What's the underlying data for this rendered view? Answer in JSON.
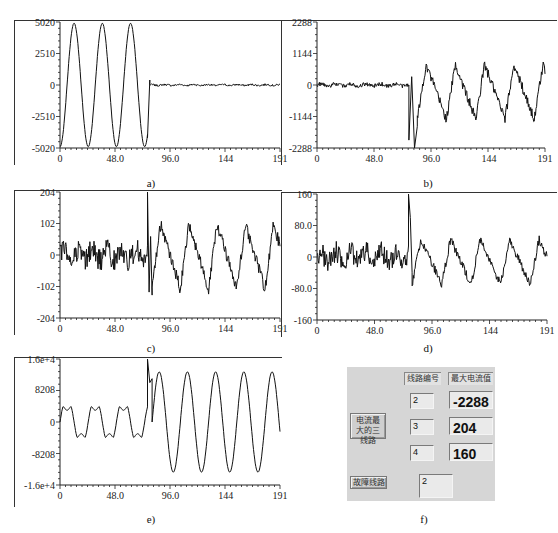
{
  "chart_data": [
    {
      "id": "a",
      "type": "line",
      "caption": "a)",
      "title": "",
      "xlabel": "",
      "ylabel": "",
      "xlim": [
        0,
        191
      ],
      "ylim": [
        -5020,
        5020
      ],
      "xticks": [
        "0",
        "48.0",
        "96.0",
        "144",
        "191"
      ],
      "xtick_values": [
        0,
        48,
        96,
        144,
        191
      ],
      "yticks": [
        "5020",
        "2510",
        "0",
        "-2510",
        "-5020"
      ],
      "ytick_values": [
        5020,
        2510,
        0,
        -2510,
        -5020
      ],
      "grid": false,
      "description": "Sinusoid amplitude ~5020 with period ~24 samples from x=0 to ~76, then drops to near-zero noise (~±100) for remainder.",
      "series": [
        {
          "name": "line-1",
          "segments": [
            {
              "x_start": 0,
              "x_end": 76,
              "shape": "sine",
              "amplitude": 5020,
              "period": 24.5,
              "phase_deg": -90
            },
            {
              "x_start": 76,
              "x_end": 78,
              "shape": "spike",
              "values": [
                -4200,
                400
              ]
            },
            {
              "x_start": 78,
              "x_end": 191,
              "shape": "noise",
              "mean": 0,
              "amplitude": 120
            }
          ]
        }
      ]
    },
    {
      "id": "b",
      "type": "line",
      "caption": "b)",
      "xlim": [
        0,
        191
      ],
      "ylim": [
        -2288,
        2288
      ],
      "xticks": [
        "0",
        "48.0",
        "96.0",
        "144",
        "191"
      ],
      "xtick_values": [
        0,
        48,
        96,
        144,
        191
      ],
      "yticks": [
        "2288",
        "1144",
        "0",
        "-1144",
        "-2288"
      ],
      "ytick_values": [
        2288,
        1144,
        0,
        -1144,
        -2288
      ],
      "grid": false,
      "description": "Near-zero noise until x~77, sharp negative dip to -2288 around x~80, then sawtooth-like oscillation between ~-1200 and ~+800 with period ~24.",
      "series": [
        {
          "name": "line-2",
          "segments": [
            {
              "x_start": 0,
              "x_end": 77,
              "shape": "noise",
              "mean": 0,
              "amplitude": 120
            },
            {
              "x_start": 77,
              "x_end": 84,
              "shape": "spike",
              "values": [
                -2000,
                300,
                -2288,
                -1500
              ]
            },
            {
              "x_start": 84,
              "x_end": 191,
              "shape": "sawtooth",
              "min": -1250,
              "max": 750,
              "period": 24.5
            }
          ]
        }
      ]
    },
    {
      "id": "c",
      "type": "line",
      "caption": "c)",
      "xlim": [
        0,
        191
      ],
      "ylim": [
        -204,
        204
      ],
      "xticks": [
        "0",
        "48.0",
        "96.0",
        "144",
        "191"
      ],
      "xtick_values": [
        0,
        48,
        96,
        144,
        191
      ],
      "yticks": [
        "204",
        "102",
        "0",
        "-102",
        "-204"
      ],
      "ytick_values": [
        204,
        102,
        0,
        -102,
        -204
      ],
      "grid": false,
      "description": "Noisy signal around 0 (±60) until x~77, spike to 204 at x~77, then oscillation between ~-120 and ~+100 with period ~24 plus noise.",
      "series": [
        {
          "name": "line-3",
          "segments": [
            {
              "x_start": 0,
              "x_end": 76,
              "shape": "noise",
              "mean": 0,
              "amplitude": 60
            },
            {
              "x_start": 76,
              "x_end": 80,
              "shape": "spike",
              "values": [
                204,
                -120,
                60,
                -130
              ]
            },
            {
              "x_start": 80,
              "x_end": 191,
              "shape": "sawtooth",
              "min": -110,
              "max": 100,
              "period": 24.5
            }
          ]
        }
      ]
    },
    {
      "id": "d",
      "type": "line",
      "caption": "d)",
      "xlim": [
        0,
        191
      ],
      "ylim": [
        -160,
        160
      ],
      "xticks": [
        "0",
        "48.0",
        "96.0",
        "144",
        "191"
      ],
      "xtick_values": [
        0,
        48,
        96,
        144,
        191
      ],
      "yticks": [
        "160",
        "80.0",
        "0",
        "-80.0",
        "-160"
      ],
      "ytick_values": [
        160,
        80,
        0,
        -80,
        -160
      ],
      "grid": false,
      "description": "Noisy signal around 0 (±50) until x~77, spike to 160 at x~77, then oscillation between ~-70 and ~+45 with period ~24 plus noise.",
      "series": [
        {
          "name": "line-4",
          "segments": [
            {
              "x_start": 0,
              "x_end": 76,
              "shape": "noise",
              "mean": 0,
              "amplitude": 45
            },
            {
              "x_start": 76,
              "x_end": 79,
              "shape": "spike",
              "values": [
                160,
                100,
                -40
              ]
            },
            {
              "x_start": 79,
              "x_end": 191,
              "shape": "sawtooth",
              "min": -70,
              "max": 45,
              "period": 24.5
            }
          ]
        }
      ]
    },
    {
      "id": "e",
      "type": "line",
      "caption": "e)",
      "xlim": [
        0,
        191
      ],
      "ylim": [
        -16000,
        16000
      ],
      "xticks": [
        "0",
        "48.0",
        "96.0",
        "144",
        "191"
      ],
      "xtick_values": [
        0,
        48,
        96,
        144,
        191
      ],
      "yticks": [
        "1.6e+4",
        "8208",
        "0",
        "-8208",
        "-1.6e+4"
      ],
      "ytick_values": [
        16000,
        8208,
        0,
        -8208,
        -16000
      ],
      "grid": false,
      "description": "Flat-topped periodic wave amplitude ~3500 until x~77, jump to 1.6e+4 at x~77, then large sinusoid amplitude ~13000 with period ~24.5.",
      "series": [
        {
          "name": "zero-sequence",
          "segments": [
            {
              "x_start": 0,
              "x_end": 76,
              "shape": "flat-top-wave",
              "amplitude": 3500,
              "period": 24.5
            },
            {
              "x_start": 76,
              "x_end": 80,
              "shape": "spike",
              "values": [
                16000,
                10000,
                11000
              ]
            },
            {
              "x_start": 80,
              "x_end": 191,
              "shape": "sine",
              "amplitude": 13000,
              "period": 24.5
            }
          ]
        }
      ]
    }
  ],
  "panel": {
    "caption": "f)",
    "header_line_no": "线路编号",
    "header_max_current": "最大电流值",
    "button_top3": "电流最大的三线路",
    "button_fault": "故障线路",
    "rows": [
      {
        "line": "2",
        "max_current": "-2288"
      },
      {
        "line": "3",
        "max_current": "204"
      },
      {
        "line": "4",
        "max_current": "160"
      }
    ],
    "fault_line": "2"
  }
}
